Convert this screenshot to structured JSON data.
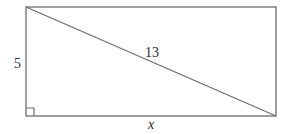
{
  "diagram": {
    "type": "rectangle-with-diagonal",
    "stroke_color": "#6e6e6e",
    "text_color": "#2a2a2a",
    "rectangle": {
      "x1": 26,
      "y1": 7,
      "x2": 276,
      "y2": 116
    },
    "diagonal": {
      "from": [
        26,
        7
      ],
      "to": [
        276,
        116
      ],
      "label": "13"
    },
    "left_side": {
      "label": "5"
    },
    "bottom_side": {
      "label": "x"
    },
    "right_angle_marker": {
      "corner": "bottom-left",
      "size": 8
    }
  }
}
